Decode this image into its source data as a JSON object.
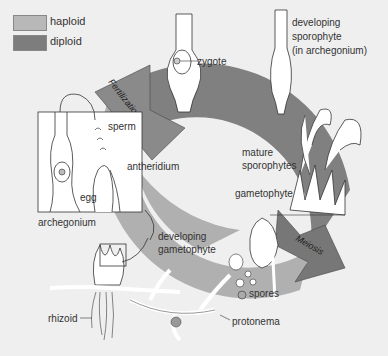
{
  "legend": {
    "items": [
      {
        "label": "haploid",
        "color": "#b8b8b8"
      },
      {
        "label": "diploid",
        "color": "#7d7d7d"
      }
    ]
  },
  "colors": {
    "background": "#efefef",
    "haploid": "#b5b5b5",
    "diploid": "#808080",
    "arrow": "#8a8a8a",
    "structure": "#ffffff",
    "outline": "#333333"
  },
  "arrows": {
    "fertilization": "Fertilization",
    "meiosis": "Meiosis"
  },
  "labels": {
    "zygote": "zygote",
    "developing_sporophyte": [
      "developing",
      "sporophyte",
      "(in archegonium)"
    ],
    "sperm": "sperm",
    "antheridium": "antheridium",
    "egg": "egg",
    "archegonium": "archegonium",
    "mature_sporophytes": [
      "mature",
      "sporophytes"
    ],
    "gametophyte": "gametophyte",
    "developing_gametophyte": [
      "developing",
      "gametophyte"
    ],
    "spores": "spores",
    "rhizoid": "rhizoid",
    "protonema": "protonema"
  }
}
